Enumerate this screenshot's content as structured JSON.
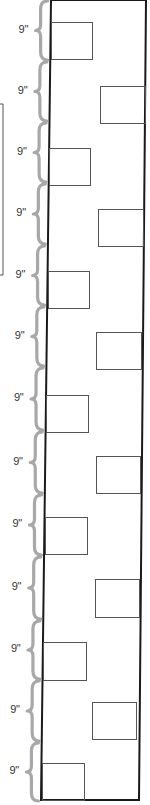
{
  "diagram": {
    "type": "wall elevation with alternating window openings",
    "spacing_label": "9\"",
    "segment_count": 13,
    "segments": [
      {
        "label": "9\"",
        "y_top": 0,
        "y_bottom": 61,
        "window_side": "left"
      },
      {
        "label": "9\"",
        "y_top": 61,
        "y_bottom": 122,
        "window_side": "right"
      },
      {
        "label": "9\"",
        "y_top": 122,
        "y_bottom": 183,
        "window_side": "left"
      },
      {
        "label": "9\"",
        "y_top": 183,
        "y_bottom": 245,
        "window_side": "right"
      },
      {
        "label": "9\"",
        "y_top": 245,
        "y_bottom": 306,
        "window_side": "left"
      },
      {
        "label": "9\"",
        "y_top": 306,
        "y_bottom": 367,
        "window_side": "right"
      },
      {
        "label": "9\"",
        "y_top": 367,
        "y_bottom": 431,
        "window_side": "left"
      },
      {
        "label": "9\"",
        "y_top": 431,
        "y_bottom": 494,
        "window_side": "right"
      },
      {
        "label": "9\"",
        "y_top": 494,
        "y_bottom": 556,
        "window_side": "left"
      },
      {
        "label": "9\"",
        "y_top": 556,
        "y_bottom": 620,
        "window_side": "right"
      },
      {
        "label": "9\"",
        "y_top": 620,
        "y_bottom": 680,
        "window_side": "left"
      },
      {
        "label": "9\"",
        "y_top": 680,
        "y_bottom": 742,
        "window_side": "right"
      },
      {
        "label": "9\"",
        "y_top": 742,
        "y_bottom": 802,
        "window_side": "left"
      }
    ],
    "colors": {
      "outline": "#1a1a1a",
      "window_stroke": "#555555",
      "brace": "#a8a8a8",
      "label": "#333333",
      "background": "#ffffff"
    }
  }
}
